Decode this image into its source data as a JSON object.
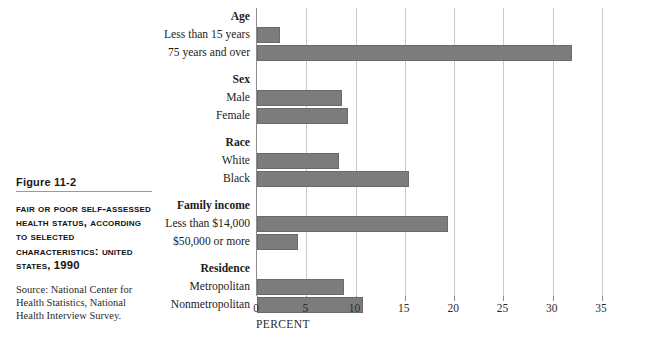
{
  "caption": {
    "figure_number": "Figure 11-2",
    "title": "Fair or Poor Self-assessed Health Status, According to Selected Characteristics: United States, 1990",
    "source": "Source: National Center for Health Statistics, National Health Interview Survey."
  },
  "chart_data": {
    "type": "bar",
    "orientation": "horizontal",
    "title": "Fair or Poor Self-assessed Health Status, According to Selected Characteristics: United States, 1990",
    "xlabel": "PERCENT",
    "ylabel": "",
    "xlim": [
      0,
      35
    ],
    "xticks": [
      0,
      5,
      10,
      15,
      20,
      25,
      30,
      35
    ],
    "xtick_labels": [
      "0",
      "5",
      "10",
      "15",
      "20",
      "25",
      "30",
      "35"
    ],
    "grid": true,
    "legend": false,
    "bar_color": "#7c7c7c",
    "groups": [
      {
        "name": "Age",
        "items": [
          {
            "label": "Less than 15 years",
            "value": 2.3
          },
          {
            "label": "75 years and over",
            "value": 32.0
          }
        ]
      },
      {
        "name": "Sex",
        "items": [
          {
            "label": "Male",
            "value": 8.6
          },
          {
            "label": "Female",
            "value": 9.2
          }
        ]
      },
      {
        "name": "Race",
        "items": [
          {
            "label": "White",
            "value": 8.3
          },
          {
            "label": "Black",
            "value": 15.4
          }
        ]
      },
      {
        "name": "Family income",
        "items": [
          {
            "label": "Less than $14,000",
            "value": 19.4
          },
          {
            "label": "$50,000 or more",
            "value": 4.2
          }
        ]
      },
      {
        "name": "Residence",
        "items": [
          {
            "label": "Metropolitan",
            "value": 8.8
          },
          {
            "label": "Nonmetropolitan",
            "value": 10.8
          }
        ]
      }
    ]
  }
}
